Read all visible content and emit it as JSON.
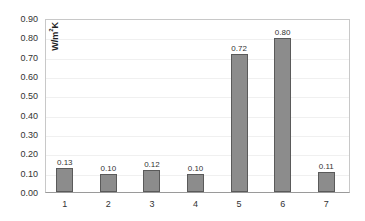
{
  "chart_data": {
    "type": "bar",
    "title": "",
    "xlabel": "",
    "ylabel": "W/m²K",
    "categories": [
      "1",
      "2",
      "3",
      "4",
      "5",
      "6",
      "7"
    ],
    "values": [
      0.13,
      0.1,
      0.12,
      0.1,
      0.72,
      0.8,
      0.11
    ],
    "data_labels": [
      "0.13",
      "0.10",
      "0.12",
      "0.10",
      "0.72",
      "0.80",
      "0.11"
    ],
    "ylim": [
      0.0,
      0.9
    ],
    "yticks": [
      "0.00",
      "0.10",
      "0.20",
      "0.30",
      "0.40",
      "0.50",
      "0.60",
      "0.70",
      "0.80",
      "0.90"
    ],
    "grid": true,
    "legend": null,
    "bar_color": "#8c8c8c",
    "bar_edge_color": "#5a5a5a"
  }
}
